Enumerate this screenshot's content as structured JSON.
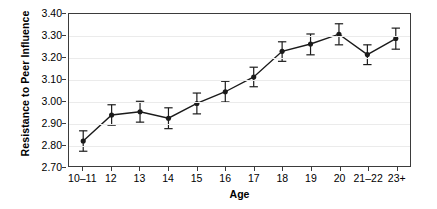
{
  "chart_data": {
    "type": "line",
    "title": "",
    "xlabel": "Age",
    "ylabel": "Resistance to Peer Influence",
    "categories": [
      "10–11",
      "12",
      "13",
      "14",
      "15",
      "16",
      "17",
      "18",
      "19",
      "20",
      "21–22",
      "23+"
    ],
    "values": [
      2.815,
      2.935,
      2.95,
      2.92,
      2.988,
      3.042,
      3.11,
      3.228,
      3.262,
      3.307,
      3.213,
      3.287
    ],
    "error_low": [
      2.768,
      2.888,
      2.902,
      2.872,
      2.94,
      2.995,
      3.065,
      3.182,
      3.212,
      3.258,
      3.167,
      3.238
    ],
    "error_high": [
      2.862,
      2.982,
      2.998,
      2.968,
      3.036,
      3.09,
      3.155,
      3.272,
      3.308,
      3.355,
      3.258,
      3.335
    ],
    "ylim": [
      2.7,
      3.4
    ],
    "yticks": [
      "2.70",
      "2.80",
      "2.90",
      "3.00",
      "3.10",
      "3.20",
      "3.30",
      "3.40"
    ],
    "ytick_values": [
      2.7,
      2.8,
      2.9,
      3.0,
      3.1,
      3.2,
      3.3,
      3.4
    ],
    "grid": true,
    "legend": "none",
    "marker": "filled-circle",
    "error_bars": true,
    "line_color": "#1a1a1a",
    "marker_color": "#1a1a1a",
    "grid_color": "#ebebeb",
    "axis_color": "#3b3b3b"
  }
}
